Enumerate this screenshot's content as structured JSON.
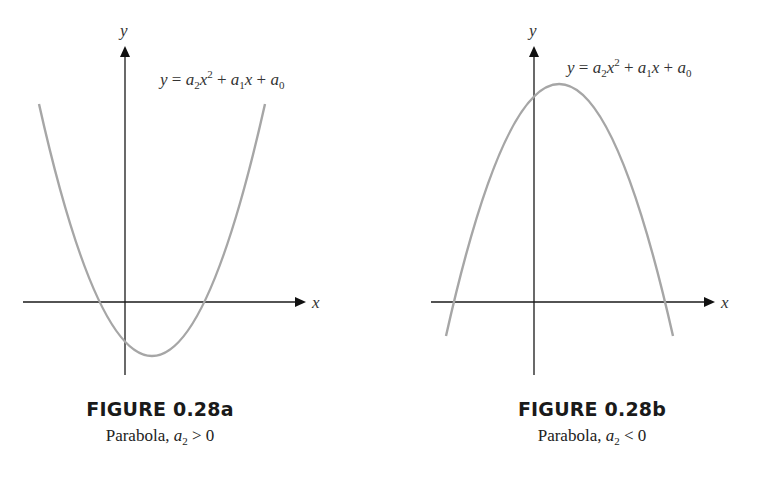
{
  "figures": [
    {
      "id": "0.28a",
      "title": "FIGURE 0.28a",
      "caption_prefix": "Parabola, ",
      "caption_var": "a",
      "caption_sub": "2",
      "caption_relation": " > 0",
      "equation": {
        "lhs": "y",
        "eq": " = ",
        "t1": "a",
        "t1_sub": "2",
        "t1_var": "x",
        "t1_sup": "2",
        "plus1": " + ",
        "t2": "a",
        "t2_sub": "1",
        "t2_var": "x",
        "plus2": " + ",
        "t3": "a",
        "t3_sub": "0"
      },
      "axis_labels": {
        "x": "x",
        "y": "y"
      },
      "curve_color": "#a6a6a6",
      "orientation": "opens upward"
    },
    {
      "id": "0.28b",
      "title": "FIGURE 0.28b",
      "caption_prefix": "Parabola, ",
      "caption_var": "a",
      "caption_sub": "2",
      "caption_relation": " < 0",
      "equation": {
        "lhs": "y",
        "eq": " = ",
        "t1": "a",
        "t1_sub": "2",
        "t1_var": "x",
        "t1_sup": "2",
        "plus1": " + ",
        "t2": "a",
        "t2_sub": "1",
        "t2_var": "x",
        "plus2": " + ",
        "t3": "a",
        "t3_sub": "0"
      },
      "axis_labels": {
        "x": "x",
        "y": "y"
      },
      "curve_color": "#a6a6a6",
      "orientation": "opens downward"
    }
  ]
}
